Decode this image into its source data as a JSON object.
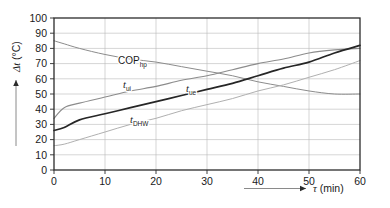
{
  "chart_data": {
    "type": "line",
    "title": "",
    "xlabel": "τ (min)",
    "ylabel": "Δt (°C)",
    "xlim": [
      0,
      60
    ],
    "ylim": [
      0,
      100
    ],
    "xticks": [
      "0",
      "10",
      "20",
      "30",
      "40",
      "50",
      "60"
    ],
    "yticks": [
      "0",
      "10",
      "20",
      "30",
      "40",
      "50",
      "60",
      "70",
      "80",
      "90",
      "100"
    ],
    "grid": true,
    "legend_position": "inline-labels",
    "x": [
      0,
      2,
      5,
      10,
      15,
      20,
      25,
      30,
      35,
      40,
      45,
      50,
      55,
      60
    ],
    "series": [
      {
        "name": "COP_hp",
        "label_main": "COP",
        "label_sub": "hp",
        "color": "#8c8c8c",
        "width": 1.0,
        "values": [
          85,
          83,
          80,
          76,
          73,
          71,
          68,
          65,
          62,
          58,
          55,
          52,
          50,
          50
        ]
      },
      {
        "name": "t_ui",
        "label_main": "t",
        "label_sub": "ui",
        "color": "#8c8c8c",
        "width": 1.1,
        "values": [
          34,
          41,
          44,
          48,
          52,
          55,
          59,
          62,
          66,
          70,
          73,
          77,
          79,
          80
        ]
      },
      {
        "name": "t_ue",
        "label_main": "t",
        "label_sub": "ue",
        "color": "#262626",
        "width": 1.7,
        "values": [
          26,
          28,
          33,
          37,
          41,
          45,
          49,
          53,
          57,
          62,
          67,
          71,
          77,
          82
        ]
      },
      {
        "name": "t_DHW",
        "label_main": "t",
        "label_sub": "DHW",
        "color": "#b0b0b0",
        "width": 1.0,
        "values": [
          16,
          17,
          20,
          25,
          30,
          34,
          39,
          43,
          47,
          52,
          56,
          61,
          66,
          72
        ]
      }
    ],
    "annotations": [
      {
        "name": "cop-label",
        "text_main": "COP",
        "text_sub": "hp",
        "x": 118,
        "y": 64
      },
      {
        "name": "tui-label",
        "text_main": "t",
        "text_sub": "ui",
        "x": 123,
        "y": 88
      },
      {
        "name": "tue-label",
        "text_main": "t",
        "text_sub": "ue",
        "x": 186,
        "y": 92
      },
      {
        "name": "tdhw-label",
        "text_main": "t",
        "text_sub": "DHW",
        "x": 130,
        "y": 123
      }
    ]
  },
  "axes": {
    "y_axis_symbol": "Δt",
    "y_axis_unit": "(°C)",
    "x_axis_symbol": "τ",
    "x_axis_unit": "(min)"
  }
}
